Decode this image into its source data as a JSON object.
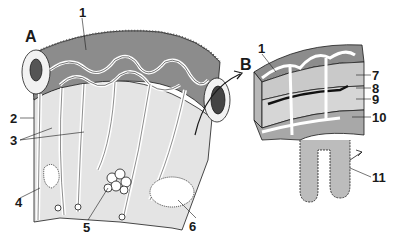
{
  "figure": {
    "panels": [
      {
        "id": "A",
        "label": "A"
      },
      {
        "id": "B",
        "label": "B"
      }
    ],
    "callouts": [
      {
        "num": "1",
        "panel": "A"
      },
      {
        "num": "2",
        "panel": "A"
      },
      {
        "num": "3",
        "panel": "A"
      },
      {
        "num": "4",
        "panel": "A"
      },
      {
        "num": "5",
        "panel": "A"
      },
      {
        "num": "6",
        "panel": "A"
      },
      {
        "num": "1",
        "panel": "B"
      },
      {
        "num": "7",
        "panel": "B"
      },
      {
        "num": "8",
        "panel": "B"
      },
      {
        "num": "9",
        "panel": "B"
      },
      {
        "num": "10",
        "panel": "B"
      },
      {
        "num": "11",
        "panel": "B"
      }
    ],
    "colors": {
      "background": "#ffffff",
      "dark_tissue": "#8a8a8a",
      "mid_tissue": "#bdbdbd",
      "light_tissue": "#e6e6e6",
      "vessel": "#ffffff",
      "ink": "#1a1a1a"
    }
  }
}
